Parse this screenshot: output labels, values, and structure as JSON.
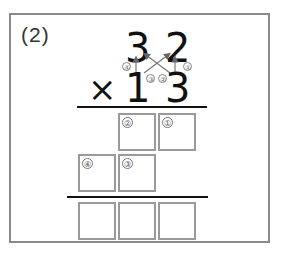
{
  "problem": {
    "label": "(2)",
    "multiplicand": [
      "3",
      "2"
    ],
    "operator": "×",
    "multiplier": [
      "1",
      "3"
    ]
  },
  "step_markers": {
    "arrow_1": "①",
    "arrow_2": "②",
    "arrow_3": "③",
    "arrow_4": "④"
  },
  "partial_row1": {
    "boxes": [
      {
        "marker": "②",
        "value": ""
      },
      {
        "marker": "①",
        "value": ""
      }
    ]
  },
  "partial_row2": {
    "boxes": [
      {
        "marker": "④",
        "value": ""
      },
      {
        "marker": "③",
        "value": ""
      }
    ]
  },
  "answer_row": {
    "boxes": [
      {
        "value": ""
      },
      {
        "value": ""
      },
      {
        "value": ""
      }
    ]
  }
}
